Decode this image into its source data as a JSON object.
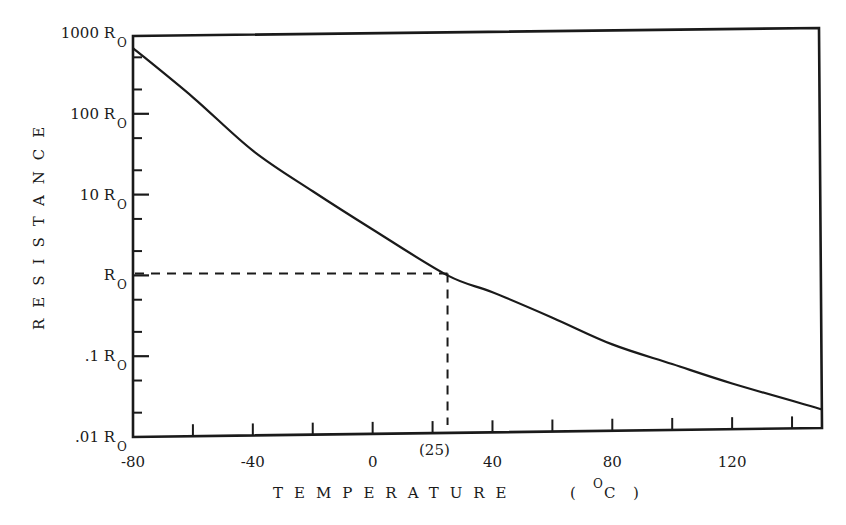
{
  "chart_data": {
    "type": "line",
    "title": "",
    "xlabel": "TEMPERATURE ( °C )",
    "ylabel": "RESISTANCE",
    "yscale": "log",
    "xlim": [
      -80,
      150
    ],
    "ylim": [
      0.01,
      1000
    ],
    "grid": false,
    "x_ticks": [
      -80,
      -40,
      0,
      40,
      80,
      120
    ],
    "x_minor_ticks": [
      -60,
      -20,
      20,
      60,
      100,
      140
    ],
    "y_ticks": [
      {
        "value": 1000,
        "label": "1000 R",
        "sub": "O"
      },
      {
        "value": 100,
        "label": "100 R",
        "sub": "O"
      },
      {
        "value": 10,
        "label": "10 R",
        "sub": "O"
      },
      {
        "value": 1,
        "label": "R",
        "sub": "O"
      },
      {
        "value": 0.1,
        "label": ".1 R",
        "sub": "O"
      },
      {
        "value": 0.01,
        "label": ".01 R",
        "sub": "O"
      }
    ],
    "annotation": {
      "label": "(25)",
      "x": 25,
      "y": 1.0,
      "style": "dashed reference lines to axes"
    },
    "series": [
      {
        "name": "Resistance (multiples of Ro)",
        "x": [
          -80,
          -60,
          -40,
          -20,
          0,
          25,
          40,
          60,
          80,
          100,
          120,
          150
        ],
        "values": [
          650,
          160,
          35,
          11,
          3.7,
          1.0,
          0.62,
          0.3,
          0.14,
          0.08,
          0.046,
          0.022
        ]
      }
    ]
  },
  "labels": {
    "x_title": "TEMPERATURE",
    "x_unit_open": "(",
    "x_unit_deg": "O",
    "x_unit_c": "C",
    "x_unit_close": ")",
    "y_title": "RESISTANCE",
    "annotation": "(25)"
  },
  "style": {
    "ink": "#1a1a1a",
    "background": "#ffffff"
  }
}
